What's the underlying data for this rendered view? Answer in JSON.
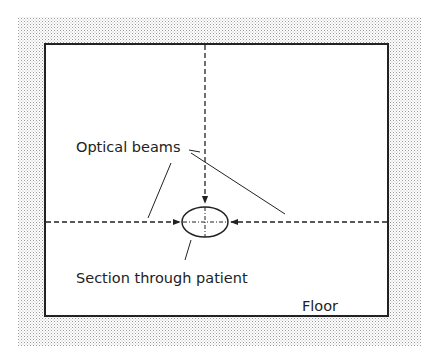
{
  "diagram": {
    "labels": {
      "optical_beams": "Optical beams",
      "section_through_patient": "Section through patient",
      "floor": "Floor"
    },
    "colors": {
      "ink": "#222222",
      "stipple": "#bdbdbd",
      "background": "#ffffff"
    }
  }
}
